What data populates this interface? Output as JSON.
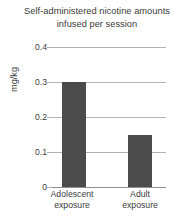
{
  "chart_data": {
    "type": "bar",
    "title": "Self-administered nicotine amounts infused per session",
    "title_lines": [
      "Self-administered nicotine amounts",
      "infused per session"
    ],
    "xlabel": "",
    "ylabel": "mg/kg",
    "categories": [
      "Adolescent exposure",
      "Adult exposure"
    ],
    "category_lines": [
      [
        "Adolescent",
        "exposure"
      ],
      [
        "Adult",
        "exposure"
      ]
    ],
    "values": [
      0.3,
      0.15
    ],
    "ylim": [
      0,
      0.4
    ],
    "yticks": [
      0,
      0.1,
      0.2,
      0.3,
      0.4
    ],
    "ytick_labels": [
      "0",
      "0.1",
      "0.2",
      "0.3",
      "0.4"
    ],
    "grid": true,
    "legend": false,
    "bar_color": "#4b4b4b",
    "gridline_color": "#b3b3b3",
    "text_color": "#3c3c3c",
    "background_color": "#ffffff"
  }
}
